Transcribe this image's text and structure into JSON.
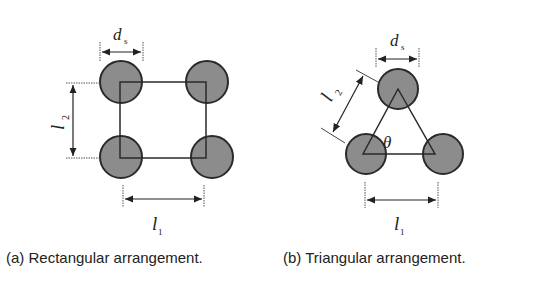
{
  "figure": {
    "panels": [
      {
        "id": "a",
        "caption": "(a) Rectangular arrangement.",
        "shape": "rectangle",
        "circle_count": 4,
        "labels": {
          "diameter": "d",
          "diameter_sub": "s",
          "height": "l",
          "height_sub": "2",
          "width": "l",
          "width_sub": "1"
        }
      },
      {
        "id": "b",
        "caption": "(b) Triangular arrangement.",
        "shape": "triangle",
        "circle_count": 3,
        "labels": {
          "diameter": "d",
          "diameter_sub": "s",
          "side": "l",
          "side_sub": "2",
          "width": "l",
          "width_sub": "1",
          "angle": "θ"
        }
      }
    ],
    "colors": {
      "circle_fill": "#8c8c8c",
      "stroke": "#2a2a2a",
      "background": "#ffffff"
    }
  }
}
